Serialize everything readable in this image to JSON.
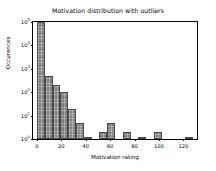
{
  "chart_data": {
    "type": "bar",
    "title": "Motivation distribution with outliers",
    "xlabel": "Motivation rating",
    "ylabel": "Occurences",
    "yscale": "log",
    "xlim": [
      -3.2,
      131.2
    ],
    "ylim": [
      1,
      100000
    ],
    "grid": false,
    "legend": null,
    "bin_width": 6.4,
    "xticks": [
      0,
      20,
      40,
      60,
      80,
      100,
      120
    ],
    "xticklabels": [
      "0",
      "20",
      "40",
      "60",
      "80",
      "100",
      "120"
    ],
    "yticks": [
      1,
      10,
      100,
      1000,
      10000,
      100000
    ],
    "yticklabels": [
      "10",
      "10",
      "10",
      "10",
      "10",
      "10"
    ],
    "yticklabel_exponents": [
      "0",
      "1",
      "2",
      "3",
      "4",
      "5"
    ],
    "bar_color": "#7f7f7f",
    "bar_edge_color": "#4a4a4a",
    "bins": [
      {
        "x0": 0.0,
        "x1": 6.4,
        "count": 100000
      },
      {
        "x0": 6.4,
        "x1": 12.8,
        "count": 500
      },
      {
        "x0": 12.8,
        "x1": 19.2,
        "count": 200
      },
      {
        "x0": 19.2,
        "x1": 25.6,
        "count": 100
      },
      {
        "x0": 25.6,
        "x1": 32.0,
        "count": 20
      },
      {
        "x0": 32.0,
        "x1": 38.4,
        "count": 5
      },
      {
        "x0": 38.4,
        "x1": 44.8,
        "count": 1
      },
      {
        "x0": 44.8,
        "x1": 51.2,
        "count": 0
      },
      {
        "x0": 51.2,
        "x1": 57.6,
        "count": 2
      },
      {
        "x0": 57.6,
        "x1": 64.0,
        "count": 5
      },
      {
        "x0": 64.0,
        "x1": 70.4,
        "count": 0
      },
      {
        "x0": 70.4,
        "x1": 76.8,
        "count": 2
      },
      {
        "x0": 76.8,
        "x1": 83.2,
        "count": 0
      },
      {
        "x0": 83.2,
        "x1": 89.6,
        "count": 1
      },
      {
        "x0": 89.6,
        "x1": 96.0,
        "count": 0
      },
      {
        "x0": 96.0,
        "x1": 102.4,
        "count": 2
      },
      {
        "x0": 102.4,
        "x1": 108.8,
        "count": 0
      },
      {
        "x0": 108.8,
        "x1": 115.2,
        "count": 0
      },
      {
        "x0": 115.2,
        "x1": 121.6,
        "count": 0
      },
      {
        "x0": 121.6,
        "x1": 128.0,
        "count": 1
      }
    ]
  }
}
